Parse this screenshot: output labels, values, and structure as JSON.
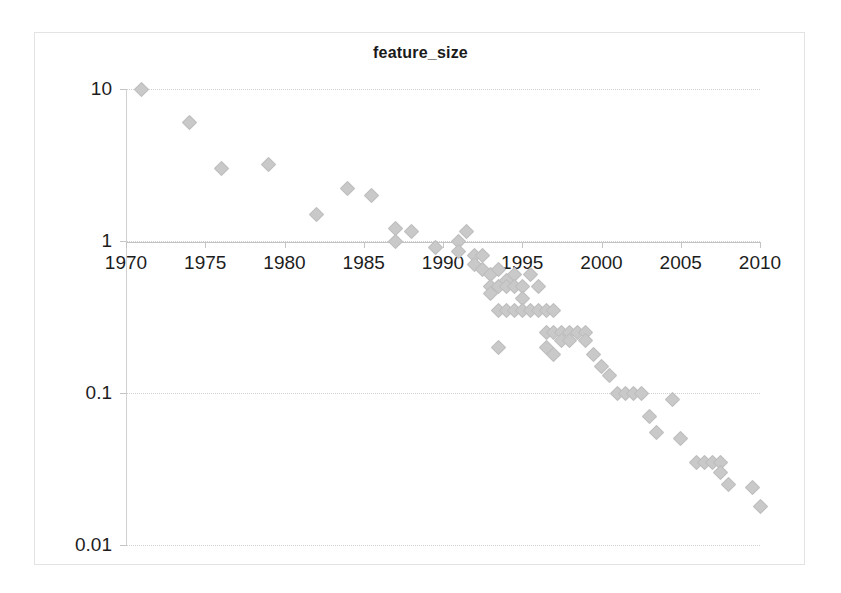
{
  "chart": {
    "title": "feature_size",
    "background_color": "#ffffff",
    "frame_color": "#e3e3e3",
    "marker_color": "#c9c9c9",
    "axis_color": "#c4c4c4",
    "gridline_color": "#cfcfcf",
    "text_color": "#1d1d1d"
  },
  "chart_data": {
    "type": "scatter",
    "title": "feature_size",
    "xlabel": "",
    "ylabel": "",
    "yscale": "log",
    "xscale": "linear",
    "xlim": [
      1970,
      2010
    ],
    "ylim": [
      0.01,
      10
    ],
    "grid": true,
    "legend": false,
    "x_ticks": [
      1970,
      1975,
      1980,
      1985,
      1990,
      1995,
      2000,
      2005,
      2010
    ],
    "x_tick_labels": [
      "1970",
      "1975",
      "1980",
      "1985",
      "1990",
      "1995",
      "2000",
      "2005",
      "2010"
    ],
    "y_ticks": [
      10,
      1,
      0.1,
      0.01
    ],
    "y_tick_labels": [
      "10",
      "1",
      "0.1",
      "0.01"
    ],
    "axis_crosses_at_y": 1,
    "series": [
      {
        "name": "feature_size",
        "marker": "diamond",
        "color": "#c9c9c9",
        "points": [
          [
            1971,
            10.0
          ],
          [
            1974,
            6.0
          ],
          [
            1976,
            3.0
          ],
          [
            1979,
            3.2
          ],
          [
            1982,
            1.5
          ],
          [
            1984,
            2.2
          ],
          [
            1985.5,
            2.0
          ],
          [
            1987,
            1.2
          ],
          [
            1987,
            1.0
          ],
          [
            1988,
            1.15
          ],
          [
            1989.5,
            0.9
          ],
          [
            1991,
            1.0
          ],
          [
            1991.5,
            1.15
          ],
          [
            1991,
            0.85
          ],
          [
            1992,
            0.8
          ],
          [
            1992,
            0.7
          ],
          [
            1992.5,
            0.65
          ],
          [
            1992.5,
            0.8
          ],
          [
            1993,
            0.6
          ],
          [
            1993,
            0.5
          ],
          [
            1993,
            0.45
          ],
          [
            1993.5,
            0.65
          ],
          [
            1993.5,
            0.5
          ],
          [
            1993.5,
            0.35
          ],
          [
            1993.5,
            0.2
          ],
          [
            1994,
            0.55
          ],
          [
            1994,
            0.5
          ],
          [
            1994,
            0.35
          ],
          [
            1994.5,
            0.6
          ],
          [
            1994.5,
            0.5
          ],
          [
            1994.5,
            0.35
          ],
          [
            1995,
            0.5
          ],
          [
            1995,
            0.42
          ],
          [
            1995,
            0.35
          ],
          [
            1995.5,
            0.6
          ],
          [
            1995.5,
            0.35
          ],
          [
            1996,
            0.5
          ],
          [
            1996,
            0.35
          ],
          [
            1996.5,
            0.35
          ],
          [
            1996.5,
            0.25
          ],
          [
            1996.5,
            0.2
          ],
          [
            1997,
            0.35
          ],
          [
            1997,
            0.25
          ],
          [
            1997,
            0.18
          ],
          [
            1997.5,
            0.25
          ],
          [
            1997.5,
            0.22
          ],
          [
            1998,
            0.25
          ],
          [
            1998,
            0.22
          ],
          [
            1998.5,
            0.25
          ],
          [
            1999,
            0.25
          ],
          [
            1999,
            0.22
          ],
          [
            1999.5,
            0.18
          ],
          [
            2000,
            0.15
          ],
          [
            2000.5,
            0.13
          ],
          [
            2001,
            0.1
          ],
          [
            2001.5,
            0.1
          ],
          [
            2002,
            0.1
          ],
          [
            2002.5,
            0.1
          ],
          [
            2003,
            0.07
          ],
          [
            2003.5,
            0.055
          ],
          [
            2004.5,
            0.09
          ],
          [
            2005,
            0.05
          ],
          [
            2006,
            0.035
          ],
          [
            2006.5,
            0.035
          ],
          [
            2007,
            0.035
          ],
          [
            2007.5,
            0.035
          ],
          [
            2007.5,
            0.03
          ],
          [
            2008,
            0.025
          ],
          [
            2009.5,
            0.024
          ],
          [
            2010,
            0.018
          ]
        ]
      }
    ]
  }
}
